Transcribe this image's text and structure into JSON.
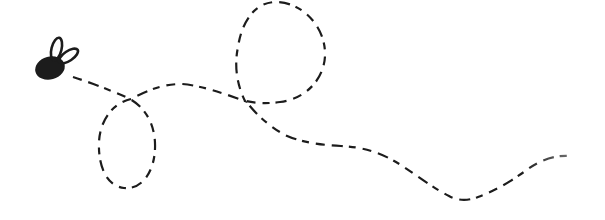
{
  "scene": {
    "alt": "Hand-drawn doodle of a small black fly with two wing loops, trailing a dashed flight path that makes a small downward loop, a large upper loop, then wiggles right and fades out",
    "background_color": "#ffffff",
    "ink_color": "#1c1c1c",
    "trail_fade_color": "#a8a8a8"
  },
  "canvas": {
    "width": "605",
    "height": "220",
    "viewbox": "0 0 605 220"
  },
  "fly": {
    "body": {
      "cx": "50",
      "cy": "68",
      "rx": "15",
      "ry": "11.5",
      "transform": "rotate(-15 50 68)"
    },
    "wing_left": {
      "cx": "56.5",
      "cy": "49",
      "rx": "5",
      "ry": "11.5",
      "transform": "rotate(14 56.5 49)"
    },
    "wing_right": {
      "cx": "68.5",
      "cy": "56",
      "rx": "4.8",
      "ry": "11",
      "transform": "rotate(56 68.5 56)"
    }
  },
  "flight_path": {
    "d": "M 73 77 C 95 84 112 91 128 98 C 146 107 156 126 155 149 C 154 173 141 190 124 188 C 107 186 98 167 99 142 C 100 120 113 103 131 99 C 148 90 163 84 182 84 C 205 86 230 96 245 101 C 237 85 234 66 238 47 C 242 20 256 2 276 2 C 301 2 324 25 325 52 C 326 78 306 99 280 102 C 266 104 254 103 246 101 C 253 111 266 124 283 134 C 299 142 320 145 341 146 C 362 147 379 152 396 162 C 414 173 431 187 449 196 C 458 201 468 201 478 197 C 497 190 513 180 528 169 C 543 158 559 155 570 156",
    "stroke_width": "2.2",
    "dash_array": "9 7 11 6 7 7",
    "wing_stroke_width": "2.6",
    "fade_start_offset": "0.86"
  }
}
